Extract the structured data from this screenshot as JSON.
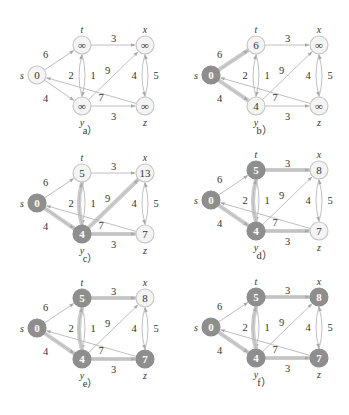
{
  "figure": {
    "colors": {
      "node_open_fill": "#f4f4f4",
      "node_open_stroke": "#c4c4c4",
      "node_filled_fill": "#8e8e8e",
      "edge_normal": "#b8b8b8",
      "edge_highlight": "#c8c8c8",
      "text": "#333333"
    },
    "nodes": [
      {
        "id": "s",
        "label": "s",
        "dx": 0,
        "dy": 30,
        "name_pos": "left"
      },
      {
        "id": "t",
        "label": "t",
        "dx": 45,
        "dy": 0,
        "name_pos": "top"
      },
      {
        "id": "x",
        "label": "x",
        "dx": 108,
        "dy": 0,
        "name_pos": "top"
      },
      {
        "id": "y",
        "label": "y",
        "dx": 45,
        "dy": 61,
        "name_pos": "bottom"
      },
      {
        "id": "z",
        "label": "z",
        "dx": 108,
        "dy": 61,
        "name_pos": "bottom"
      }
    ],
    "edges": [
      {
        "from": "s",
        "to": "t",
        "weight": "6",
        "wx": -14,
        "wy": -6,
        "curve": 0
      },
      {
        "from": "s",
        "to": "y",
        "weight": "4",
        "wx": -14,
        "wy": 8,
        "curve": 0
      },
      {
        "from": "t",
        "to": "x",
        "weight": "3",
        "wx": 0,
        "wy": -7,
        "curve": 0
      },
      {
        "from": "t",
        "to": "y",
        "weight": "2",
        "wx": -11,
        "wy": 0,
        "curve": -6
      },
      {
        "from": "y",
        "to": "t",
        "weight": "1",
        "wx": 11,
        "wy": 0,
        "curve": -6
      },
      {
        "from": "y",
        "to": "x",
        "weight": "9",
        "wx": -6,
        "wy": -5,
        "curve": 0
      },
      {
        "from": "y",
        "to": "z",
        "weight": "3",
        "wx": 0,
        "wy": 10,
        "curve": 0
      },
      {
        "from": "x",
        "to": "z",
        "weight": "4",
        "wx": -11,
        "wy": 0,
        "curve": 6
      },
      {
        "from": "z",
        "to": "x",
        "weight": "5",
        "wx": 11,
        "wy": 0,
        "curve": 6
      },
      {
        "from": "z",
        "to": "s",
        "weight": "7",
        "wx": 10,
        "wy": 7,
        "curve": 0
      }
    ],
    "panels": [
      {
        "id": "a",
        "caption": "a）",
        "ox": 37,
        "oy": 45,
        "values": {
          "s": "0",
          "t": "∞",
          "x": "∞",
          "y": "∞",
          "z": "∞"
        },
        "filled": [
          "s"
        ],
        "filled_style": "open",
        "highlighted_edges": []
      },
      {
        "id": "b",
        "caption": "b）",
        "ox": 211,
        "oy": 45,
        "values": {
          "s": "0",
          "t": "6",
          "x": "∞",
          "y": "4",
          "z": "∞"
        },
        "filled": [
          "s"
        ],
        "highlighted_edges": [
          "s-t",
          "s-y"
        ]
      },
      {
        "id": "c",
        "caption": "c）",
        "ox": 37,
        "oy": 173,
        "values": {
          "s": "0",
          "t": "5",
          "x": "13",
          "y": "4",
          "z": "7"
        },
        "filled": [
          "s",
          "y"
        ],
        "highlighted_edges": [
          "s-y",
          "y-t",
          "y-x",
          "y-z"
        ]
      },
      {
        "id": "d",
        "caption": "d）",
        "ox": 211,
        "oy": 170,
        "values": {
          "s": "0",
          "t": "5",
          "x": "8",
          "y": "4",
          "z": "7"
        },
        "filled": [
          "s",
          "y",
          "t"
        ],
        "highlighted_edges": [
          "s-y",
          "y-t",
          "t-x",
          "y-z"
        ]
      },
      {
        "id": "e",
        "caption": "e）",
        "ox": 37,
        "oy": 298,
        "values": {
          "s": "0",
          "t": "5",
          "x": "8",
          "y": "4",
          "z": "7"
        },
        "filled": [
          "s",
          "y",
          "t",
          "z"
        ],
        "highlighted_edges": [
          "s-y",
          "y-t",
          "t-x",
          "y-z"
        ]
      },
      {
        "id": "f",
        "caption": "f）",
        "ox": 211,
        "oy": 297,
        "values": {
          "s": "0",
          "t": "5",
          "x": "8",
          "y": "4",
          "z": "7"
        },
        "filled": [
          "s",
          "y",
          "t",
          "z",
          "x"
        ],
        "highlighted_edges": [
          "s-y",
          "y-t",
          "t-x",
          "y-z"
        ]
      }
    ]
  }
}
